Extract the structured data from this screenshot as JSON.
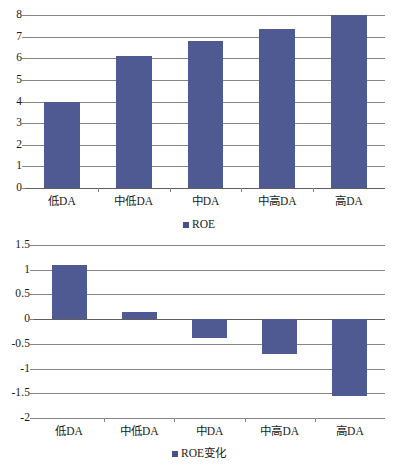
{
  "figure": {
    "background": "#ffffff",
    "bar_color": "#4f5a92",
    "grid_color": "#868686"
  },
  "chart_data": [
    {
      "type": "bar",
      "id": "roe-levels",
      "title": "",
      "xlabel": "",
      "ylabel": "",
      "categories": [
        "低DA",
        "中低DA",
        "中DA",
        "中高DA",
        "高DA"
      ],
      "series": [
        {
          "name": "ROE",
          "values": [
            4.0,
            6.1,
            6.8,
            7.35,
            8.0
          ],
          "color": "#4f5a92"
        }
      ],
      "ylim": [
        0,
        8
      ],
      "yticks": [
        0,
        1,
        2,
        3,
        4,
        5,
        6,
        7,
        8
      ],
      "ytick_labels": [
        "0",
        "1",
        "2",
        "3",
        "4",
        "5",
        "6",
        "7",
        "8"
      ],
      "grid": true,
      "legend": {
        "position": "bottom",
        "entries": [
          "ROE"
        ]
      }
    },
    {
      "type": "bar",
      "id": "roe-change",
      "title": "",
      "xlabel": "",
      "ylabel": "",
      "categories": [
        "低DA",
        "中低DA",
        "中DA",
        "中高DA",
        "高DA"
      ],
      "series": [
        {
          "name": "ROE变化",
          "values": [
            1.1,
            0.15,
            -0.39,
            -0.7,
            -1.55
          ],
          "color": "#4f5a92"
        }
      ],
      "ylim": [
        -2,
        1.5
      ],
      "yticks": [
        1.5,
        1,
        0.5,
        0,
        -0.5,
        -1,
        -1.5,
        -2
      ],
      "ytick_labels": [
        "1.5",
        "1",
        "0.5",
        "0",
        "-0.5",
        "-1",
        "-1.5",
        "-2"
      ],
      "grid": true,
      "legend": {
        "position": "bottom",
        "entries": [
          "ROE变化"
        ]
      }
    }
  ],
  "charts": {
    "top": {
      "name": "ROE by DA level",
      "ytick_labels": [
        "8",
        "7",
        "6",
        "5",
        "4",
        "3",
        "2",
        "1",
        "0"
      ],
      "categories": [
        "低DA",
        "中低DA",
        "中DA",
        "中高DA",
        "高DA"
      ],
      "values": [
        4.0,
        6.1,
        6.8,
        7.35,
        8.0
      ],
      "legend_label": "ROE"
    },
    "bottom": {
      "name": "ROE change by DA level",
      "ytick_labels": [
        "1.5",
        "1",
        "0.5",
        "0",
        "-0.5",
        "-1",
        "-1.5",
        "-2"
      ],
      "categories": [
        "低DA",
        "中低DA",
        "中DA",
        "中高DA",
        "高DA"
      ],
      "values": [
        1.1,
        0.15,
        -0.39,
        -0.7,
        -1.55
      ],
      "legend_label": "ROE变化"
    }
  }
}
